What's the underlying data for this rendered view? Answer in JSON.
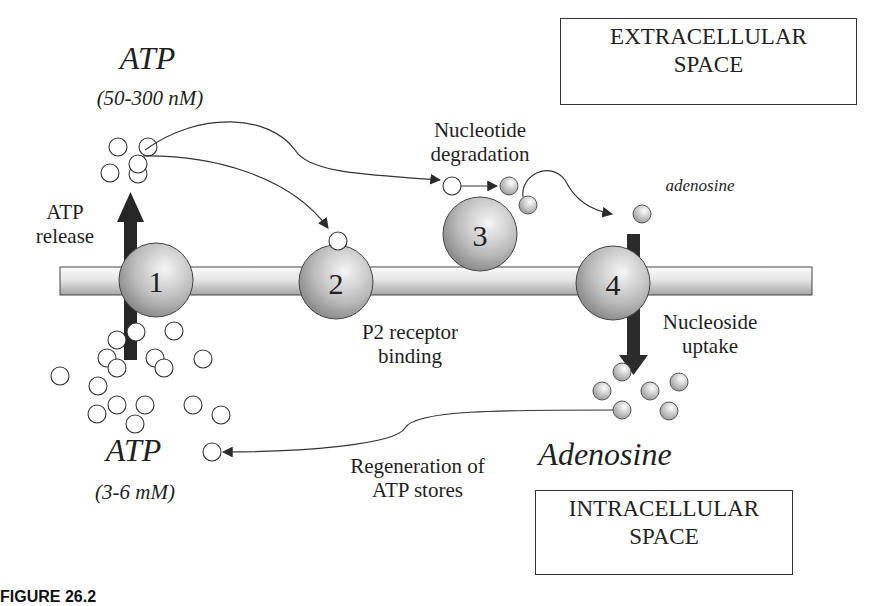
{
  "diagram": {
    "regions": {
      "extracellular": {
        "line1": "EXTRACELLULAR",
        "line2": "SPACE"
      },
      "intracellular": {
        "line1": "INTRACELLULAR",
        "line2": "SPACE"
      }
    },
    "atp_extracellular": {
      "name": "ATP",
      "concentration": "(50-300 nM)"
    },
    "atp_intracellular": {
      "name": "ATP",
      "concentration": "(3-6 mM)"
    },
    "adenosine_extracellular": {
      "name": "adenosine"
    },
    "adenosine_intracellular": {
      "name": "Adenosine"
    },
    "steps": [
      {
        "number": "1",
        "label_line1": "ATP",
        "label_line2": "release"
      },
      {
        "number": "2",
        "label_line1": "P2 receptor",
        "label_line2": "binding"
      },
      {
        "number": "3",
        "label_line1": "Nucleotide",
        "label_line2": "degradation"
      },
      {
        "number": "4",
        "label_line1": "Nucleoside",
        "label_line2": "uptake"
      }
    ],
    "regeneration": {
      "line1": "Regeneration of",
      "line2": "ATP stores"
    },
    "caption_fragment": "FIGURE 26.2"
  },
  "colors": {
    "line": "#333333",
    "arrow_dark": "#2a2a2a",
    "sphere_light": "#f4f4f4",
    "sphere_dark": "#8a8a8a",
    "membrane_light": "#fafafa",
    "membrane_dark": "#a8a8a8"
  }
}
